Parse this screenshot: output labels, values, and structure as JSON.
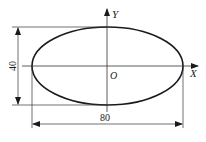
{
  "diagram": {
    "type": "ellipse-dimension-drawing",
    "axes": {
      "x_label": "X",
      "y_label": "Y",
      "origin_label": "O"
    },
    "ellipse": {
      "major_axis_length": "80",
      "minor_axis_length": "40"
    },
    "dimensions": {
      "width_label": "80",
      "height_label": "40"
    },
    "colors": {
      "line": "#1a1a1a",
      "background": "#ffffff"
    }
  }
}
